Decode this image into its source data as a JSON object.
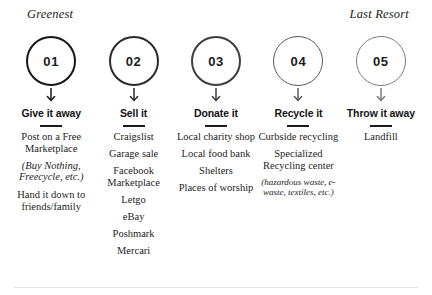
{
  "scale_labels": {
    "left": "Greenest",
    "right": "Last Resort"
  },
  "colors": {
    "ink": "#1b1b1b",
    "step1_stroke": "#161616",
    "step2_stroke": "#2a2a2a",
    "step3_stroke": "#3d3d3d",
    "step4_stroke": "#5a5a5a",
    "step5_stroke": "#7c7c7c",
    "footer_rule": "#e3e3e3"
  },
  "steps": [
    {
      "number": "01",
      "title": "Give it away",
      "stroke": "#161616",
      "stroke_width": "2.6px",
      "items": [
        {
          "text": "Post on a Free Marketplace",
          "style": "normal"
        },
        {
          "text": "(Buy Nothing, Freecycle, etc.)",
          "style": "italic"
        },
        {
          "text": "Hand it down to friends/family",
          "style": "normal"
        }
      ]
    },
    {
      "number": "02",
      "title": "Sell it",
      "stroke": "#2a2a2a",
      "stroke_width": "2.3px",
      "items": [
        {
          "text": "Craigslist",
          "style": "normal"
        },
        {
          "text": "Garage sale",
          "style": "normal"
        },
        {
          "text": "Facebook Marketplace",
          "style": "normal"
        },
        {
          "text": "Letgo",
          "style": "normal"
        },
        {
          "text": "eBay",
          "style": "normal"
        },
        {
          "text": "Poshmark",
          "style": "normal"
        },
        {
          "text": "Mercari",
          "style": "normal"
        }
      ]
    },
    {
      "number": "03",
      "title": "Donate it",
      "stroke": "#3d3d3d",
      "stroke_width": "2px",
      "items": [
        {
          "text": "Local charity shop",
          "style": "normal"
        },
        {
          "text": "Local food bank",
          "style": "normal"
        },
        {
          "text": "Shelters",
          "style": "normal"
        },
        {
          "text": "Places of worship",
          "style": "normal"
        }
      ]
    },
    {
      "number": "04",
      "title": "Recycle it",
      "stroke": "#5a5a5a",
      "stroke_width": "1.7px",
      "items": [
        {
          "text": "Curbside recycling",
          "style": "normal"
        },
        {
          "text": "Specialized Recycling center",
          "style": "normal"
        },
        {
          "text": "(hazardous waste, e-waste, textiles, etc.)",
          "style": "italic-small"
        }
      ]
    },
    {
      "number": "05",
      "title": "Throw it away",
      "stroke": "#7c7c7c",
      "stroke_width": "1.4px",
      "items": [
        {
          "text": "Landfill",
          "style": "normal"
        }
      ]
    }
  ]
}
